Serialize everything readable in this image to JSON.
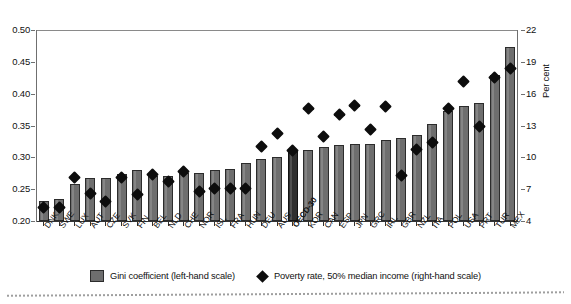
{
  "chart_data": {
    "type": "bar",
    "title": "",
    "subtitle": "",
    "xlabel": "",
    "ylabel": "",
    "ylabel_right": "Per cent",
    "grid": false,
    "legend_position": "bottom",
    "ylim": [
      0.2,
      0.5
    ],
    "ylim_right": [
      4,
      22
    ],
    "yticks": [
      "0.50",
      "0.45",
      "0.40",
      "0.35",
      "0.30",
      "0.25",
      "0.20"
    ],
    "yticks_right": [
      "22",
      "19",
      "16",
      "13",
      "10",
      "7",
      "4"
    ],
    "categories": [
      "DNK",
      "SWE",
      "LUX",
      "AUT",
      "CZE",
      "SVK",
      "FIN",
      "BEL",
      "NLD",
      "CHE",
      "NOR",
      "ISL",
      "FRA",
      "HUN",
      "DEU",
      "AUS",
      "OECD-30",
      "KOR",
      "CAN",
      "ESP",
      "JPN",
      "GRC",
      "IRL",
      "GBR",
      "NZL",
      "ITA",
      "POL",
      "USA",
      "PRT",
      "TUR",
      "MEX"
    ],
    "series": [
      {
        "name": "Gini coefficient (left-hand scale)",
        "axis": "left",
        "type": "bar",
        "color": "#6e6e6e",
        "highlight_color": "#2f2f2f",
        "highlight_category": "OECD-30",
        "values": [
          0.232,
          0.234,
          0.258,
          0.268,
          0.268,
          0.274,
          0.28,
          0.271,
          0.271,
          0.276,
          0.276,
          0.28,
          0.281,
          0.291,
          0.298,
          0.301,
          0.311,
          0.312,
          0.317,
          0.319,
          0.321,
          0.321,
          0.328,
          0.331,
          0.335,
          0.352,
          0.372,
          0.381,
          0.385,
          0.43,
          0.474
        ]
      },
      {
        "name": "Poverty rate, 50% median income (right-hand scale)",
        "axis": "right",
        "type": "scatter",
        "marker": "diamond",
        "color": "#0d0d0d",
        "values": [
          5.3,
          5.3,
          8.1,
          6.6,
          5.8,
          8.1,
          6.5,
          8.4,
          7.7,
          8.7,
          6.8,
          7.1,
          7.1,
          7.1,
          11.0,
          12.2,
          10.6,
          14.6,
          12.0,
          14.0,
          14.9,
          12.6,
          14.8,
          8.3,
          10.7,
          11.4,
          14.6,
          17.1,
          12.9,
          17.5,
          18.4
        ]
      }
    ],
    "note": "Countries ranked by increasing Gini coefficient"
  },
  "axes": {
    "left_ticks": [
      "0.50",
      "0.45",
      "0.40",
      "0.35",
      "0.30",
      "0.25",
      "0.20"
    ],
    "right_ticks": [
      "22",
      "19",
      "16",
      "13",
      "10",
      "7",
      "4"
    ],
    "right_title": "Per cent"
  },
  "legend": {
    "items": [
      {
        "label": "Gini coefficient (left-hand scale)",
        "marker": "square"
      },
      {
        "label": "Poverty rate, 50% median income (right-hand scale)",
        "marker": "diamond"
      }
    ]
  }
}
